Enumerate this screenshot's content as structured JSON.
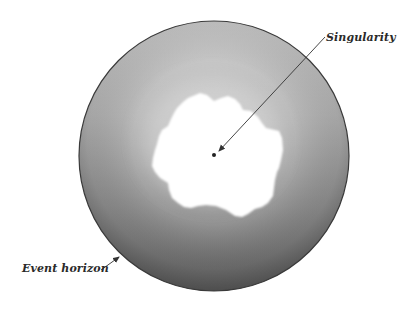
{
  "diagram": {
    "type": "black-hole-cross-section",
    "labels": {
      "singularity": "Singularity",
      "event_horizon": "Event horizon"
    },
    "colors": {
      "sphere_light": "#c4c4c4",
      "sphere_mid": "#a0a0a0",
      "sphere_dark": "#666666",
      "horizon_outline": "#3a3a3a",
      "core": "#ffffff",
      "arrow": "#333333",
      "singularity_dot": "#222222",
      "background": "#ffffff"
    }
  }
}
